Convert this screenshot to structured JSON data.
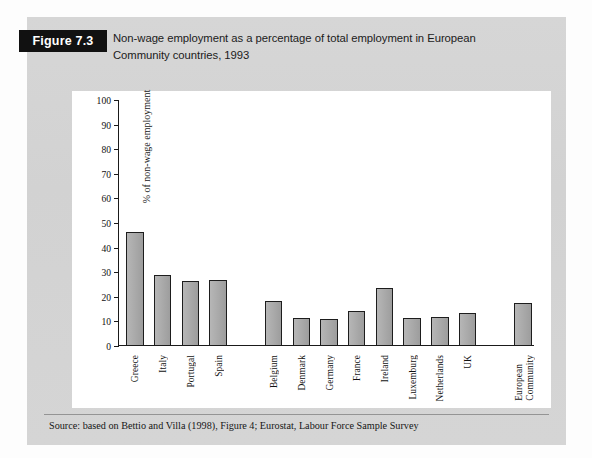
{
  "figure": {
    "badge_label": "Figure 7.3",
    "caption_line1": "Non-wage employment as a percentage of total employment in European",
    "caption_line2": "Community countries, 1993",
    "source": "Source: based on Bettio and Villa (1998), Figure 4; Eurostat, Labour Force Sample Survey"
  },
  "colors": {
    "panel_background": "#d4d4d4",
    "badge_background": "#111111",
    "badge_text": "#ffffff",
    "plot_background": "#ffffff",
    "bar_fill": "#aaaaaa",
    "bar_border": "#1d1d1d",
    "axis": "#1a1a1a"
  },
  "chart_data": {
    "type": "bar",
    "title": "Non-wage employment as a percentage of total employment in European Community countries, 1993",
    "xlabel": "",
    "ylabel": "% of non-wage employment",
    "ylim": [
      0,
      100
    ],
    "ytick_step": 10,
    "yticks": [
      0,
      10,
      20,
      30,
      40,
      50,
      60,
      70,
      80,
      90,
      100
    ],
    "ytick_labels": [
      "0",
      "10",
      "20",
      "30",
      "40",
      "50",
      "60",
      "70",
      "80",
      "90",
      "100"
    ],
    "grid": false,
    "legend": "none",
    "categories": [
      "Greece",
      "Italy",
      "Portugal",
      "Spain",
      "Belgium",
      "Denmark",
      "Germany",
      "France",
      "Ireland",
      "Luxemburg",
      "Netherlands",
      "UK",
      "European Community"
    ],
    "values": [
      46,
      28.5,
      26,
      26.5,
      18,
      11,
      10.5,
      14,
      23.5,
      11,
      11.7,
      13,
      17.3
    ],
    "groups": [
      {
        "name": "Southern Europe",
        "categories": [
          "Greece",
          "Italy",
          "Portugal",
          "Spain"
        ]
      },
      {
        "name": "Northern Europe",
        "categories": [
          "Belgium",
          "Denmark",
          "Germany",
          "France",
          "Ireland",
          "Luxemburg",
          "Netherlands",
          "UK"
        ]
      },
      {
        "name": "Aggregate",
        "categories": [
          "European Community"
        ]
      }
    ],
    "bars": [
      {
        "label": "Greece",
        "value": 46,
        "group": 0,
        "slot": 0,
        "lines": [
          "Greece"
        ]
      },
      {
        "label": "Italy",
        "value": 28.5,
        "group": 0,
        "slot": 1,
        "lines": [
          "Italy"
        ]
      },
      {
        "label": "Portugal",
        "value": 26,
        "group": 0,
        "slot": 2,
        "lines": [
          "Portugal"
        ]
      },
      {
        "label": "Spain",
        "value": 26.5,
        "group": 0,
        "slot": 3,
        "lines": [
          "Spain"
        ]
      },
      {
        "label": "Belgium",
        "value": 18,
        "group": 1,
        "slot": 5,
        "lines": [
          "Belgium"
        ]
      },
      {
        "label": "Denmark",
        "value": 11,
        "group": 1,
        "slot": 6,
        "lines": [
          "Denmark"
        ]
      },
      {
        "label": "Germany",
        "value": 10.5,
        "group": 1,
        "slot": 7,
        "lines": [
          "Germany"
        ]
      },
      {
        "label": "France",
        "value": 14,
        "group": 1,
        "slot": 8,
        "lines": [
          "France"
        ]
      },
      {
        "label": "Ireland",
        "value": 23.5,
        "group": 1,
        "slot": 9,
        "lines": [
          "Ireland"
        ]
      },
      {
        "label": "Luxemburg",
        "value": 11,
        "group": 1,
        "slot": 10,
        "lines": [
          "Luxemburg"
        ]
      },
      {
        "label": "Netherlands",
        "value": 11.7,
        "group": 1,
        "slot": 11,
        "lines": [
          "Netherlands"
        ]
      },
      {
        "label": "UK",
        "value": 13,
        "group": 1,
        "slot": 12,
        "lines": [
          "UK"
        ]
      },
      {
        "label": "European Community",
        "value": 17.3,
        "group": 2,
        "slot": 14,
        "lines": [
          "European",
          "Community"
        ]
      }
    ]
  }
}
